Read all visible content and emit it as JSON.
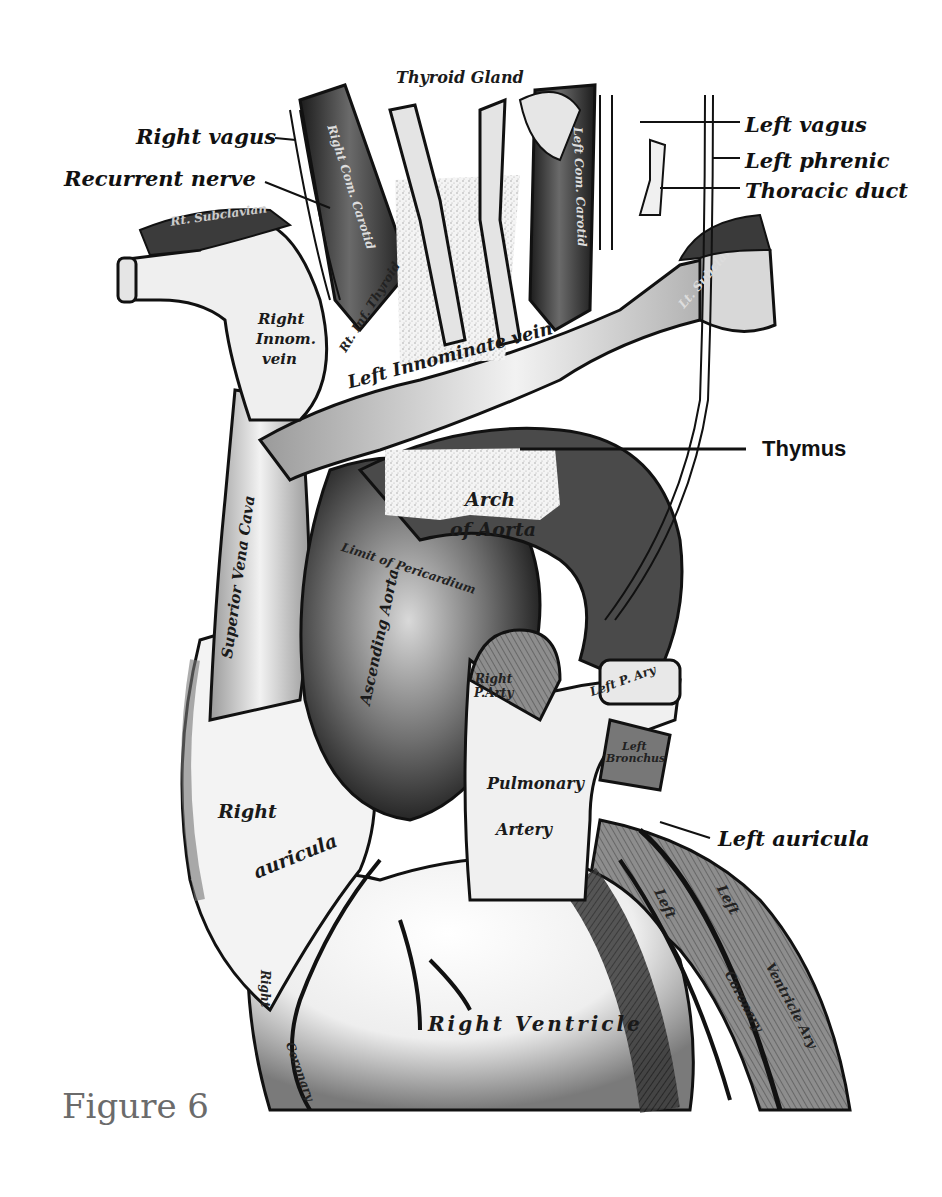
{
  "figure": {
    "caption": "Figure 6"
  },
  "labels": {
    "external": {
      "right_vagus": "Right vagus",
      "recurrent_nerve": "Recurrent nerve",
      "left_vagus": "Left vagus",
      "left_phrenic": "Left phrenic",
      "thoracic_duct": "Thoracic duct",
      "thymus": "Thymus",
      "left_auricula": "Left auricula"
    },
    "internal": {
      "thyroid_gland": "Thyroid Gland",
      "right_com_carotid": "Right Com. Carotid",
      "left_com_carotid": "Left Com. Carotid",
      "rt_subclavian": "Rt. Subclavian",
      "lt_subclavian": "Lt. Subcla.",
      "right_innom_vein_1": "Right",
      "right_innom_vein_2": "Innom.",
      "right_innom_vein_3": "vein",
      "rt_inf_thyroid_vein": "Rt. Inf. Thyroid",
      "left_innominate_vein": "Left Innominate vein",
      "superior_vena_cava": "Superior Vena Cava",
      "arch_of_aorta_1": "Arch",
      "arch_of_aorta_2": "of Aorta",
      "limit_of_pericardium": "Limit of Pericardium",
      "ascending_aorta": "Ascending Aorta",
      "right_p_artery_1": "Right",
      "right_p_artery_2": "P.Arty",
      "left_p_artery": "Left P. Ary",
      "left_bronchus_1": "Left",
      "left_bronchus_2": "Bronchus",
      "pulmonary_artery_1": "Pulmonary",
      "pulmonary_artery_2": "Artery",
      "right_auricula_1": "Right",
      "right_auricula_2": "auricula",
      "right_ventricle": "Right Ventricle",
      "right_coronary_1": "Right",
      "right_coronary_2": "Coronary",
      "left_coronary_1": "Left",
      "left_coronary_2": "Coronary",
      "left_ventricle_1": "Left",
      "left_ventricle_2": "Ventricle Ary"
    }
  },
  "colors": {
    "ink": "#111111",
    "dark_shade": "#2b2b2b",
    "mid_shade": "#6e6e6e",
    "light_shade": "#cfcfcf",
    "paper": "#ffffff",
    "caption": "#6b6b6b"
  }
}
